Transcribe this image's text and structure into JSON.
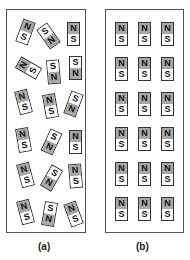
{
  "figure": {
    "panel_a": {
      "label": "(a)",
      "description": "Unmagnetized material: randomly oriented magnetic domains",
      "magnets": [
        {
          "x": 12,
          "y": 10,
          "rot": 20,
          "top": "N",
          "bottom": "S"
        },
        {
          "x": 35,
          "y": 14,
          "rot": -35,
          "top": "S",
          "bottom": "N"
        },
        {
          "x": 60,
          "y": 12,
          "rot": 0,
          "top": "N",
          "bottom": "S"
        },
        {
          "x": 15,
          "y": 46,
          "rot": -60,
          "top": "N",
          "bottom": "S"
        },
        {
          "x": 40,
          "y": 50,
          "rot": -5,
          "top": "S",
          "bottom": "N"
        },
        {
          "x": 62,
          "y": 46,
          "rot": 0,
          "top": "S",
          "bottom": "N"
        },
        {
          "x": 10,
          "y": 80,
          "rot": -15,
          "top": "N",
          "bottom": "S"
        },
        {
          "x": 37,
          "y": 84,
          "rot": -10,
          "top": "N",
          "bottom": "S"
        },
        {
          "x": 60,
          "y": 82,
          "rot": 20,
          "top": "S",
          "bottom": "N"
        },
        {
          "x": 10,
          "y": 118,
          "rot": -10,
          "top": "N",
          "bottom": "S"
        },
        {
          "x": 38,
          "y": 120,
          "rot": 25,
          "top": "S",
          "bottom": "N"
        },
        {
          "x": 62,
          "y": 120,
          "rot": 0,
          "top": "N",
          "bottom": "S"
        },
        {
          "x": 12,
          "y": 153,
          "rot": -15,
          "top": "N",
          "bottom": "S"
        },
        {
          "x": 38,
          "y": 156,
          "rot": 30,
          "top": "S",
          "bottom": "N"
        },
        {
          "x": 62,
          "y": 154,
          "rot": -5,
          "top": "N",
          "bottom": "S"
        },
        {
          "x": 12,
          "y": 190,
          "rot": -15,
          "top": "N",
          "bottom": "S"
        },
        {
          "x": 36,
          "y": 192,
          "rot": 10,
          "top": "S",
          "bottom": "N"
        },
        {
          "x": 60,
          "y": 192,
          "rot": -20,
          "top": "N",
          "bottom": "S"
        }
      ]
    },
    "panel_b": {
      "label": "(b)",
      "description": "Magnetized material: aligned magnetic domains",
      "rows": 6,
      "cols": 3,
      "pole_top": "N",
      "pole_bottom": "S"
    },
    "colors": {
      "north": "#a8a8a8",
      "south": "#ffffff",
      "border": "#333333"
    }
  }
}
